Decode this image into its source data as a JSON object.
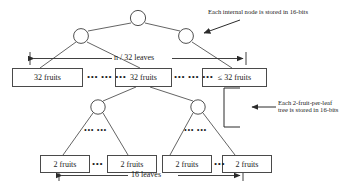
{
  "figure": {
    "background_color": "#ffffff",
    "line_color": "#3c3c3c",
    "text_color": "#1a1a1a"
  },
  "annotations": {
    "internal_node_note": "Each internal node is stored in 16-bits",
    "leaf_tree_note_line1": "Each 2-fruit-per-leaf",
    "leaf_tree_note_line2": "tree is stored in 16-bits"
  },
  "spans": {
    "top_span_label": "n / 32 leaves",
    "bottom_span_label": "16 leaves"
  },
  "top_level": {
    "boxes": [
      {
        "label": "32 fruits"
      },
      {
        "label": "32 fruits"
      },
      {
        "label": "≤ 32 fruits"
      }
    ],
    "ellipses": [
      {
        "text": "••• ••• •••"
      },
      {
        "text": "••• ••• •••"
      }
    ],
    "nodes": [
      {
        "name": "root-node"
      },
      {
        "name": "left-internal-node"
      },
      {
        "name": "right-internal-node"
      }
    ]
  },
  "bottom_level": {
    "boxes": [
      {
        "label": "2 fruits"
      },
      {
        "label": "2 fruits"
      },
      {
        "label": "2 fruits"
      },
      {
        "label": "2 fruits"
      }
    ],
    "ellipses": [
      {
        "text": "•••"
      },
      {
        "text": "•••"
      }
    ],
    "subtree_ellipses": [
      {
        "text": "••• •••"
      },
      {
        "text": "••• •••"
      }
    ],
    "nodes": [
      {
        "name": "left-subtree-node"
      },
      {
        "name": "right-subtree-node"
      }
    ]
  }
}
